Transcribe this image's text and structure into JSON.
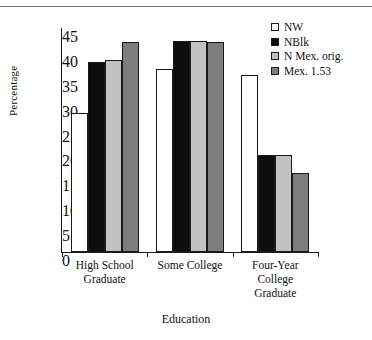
{
  "figure": {
    "background": "#ffffff",
    "rule_color": "#6f6f6f"
  },
  "chart_data": {
    "type": "bar",
    "title": "",
    "xlabel": "Education",
    "ylabel": "Percentage",
    "ylim": [
      0,
      45
    ],
    "ytick_step": 5,
    "yticks": [
      "45",
      "40",
      "35",
      "30",
      "25",
      "20",
      "15",
      "10",
      "5",
      "0"
    ],
    "grid": false,
    "legend_position": "top-right",
    "categories": [
      "High School Graduate",
      "Some College",
      "Four-Year College Graduate"
    ],
    "category_lines": [
      [
        "High School",
        "Graduate"
      ],
      [
        "Some College"
      ],
      [
        "Four-Year",
        "College",
        "Graduate"
      ]
    ],
    "series": [
      {
        "name": "NW",
        "color": "#ffffff",
        "values": [
          28.0,
          36.7,
          35.6
        ]
      },
      {
        "name": "NBlk",
        "color": "#0d0d0d",
        "values": [
          38.2,
          42.4,
          19.5
        ]
      },
      {
        "name": "N Mex. orig.",
        "color": "#c2c2c2",
        "values": [
          38.5,
          42.3,
          19.5
        ]
      },
      {
        "name": "Mex. 1.53",
        "color": "#7d7d7d",
        "values": [
          42.2,
          42.2,
          15.8
        ]
      }
    ]
  },
  "legend": {
    "entries": [
      {
        "label": "NW",
        "swatch": "#ffffff"
      },
      {
        "label": "NBlk",
        "swatch": "#0d0d0d"
      },
      {
        "label": "N Mex. orig.",
        "swatch": "#c2c2c2"
      },
      {
        "label": "Mex. 1.53",
        "swatch": "#7d7d7d"
      }
    ]
  }
}
